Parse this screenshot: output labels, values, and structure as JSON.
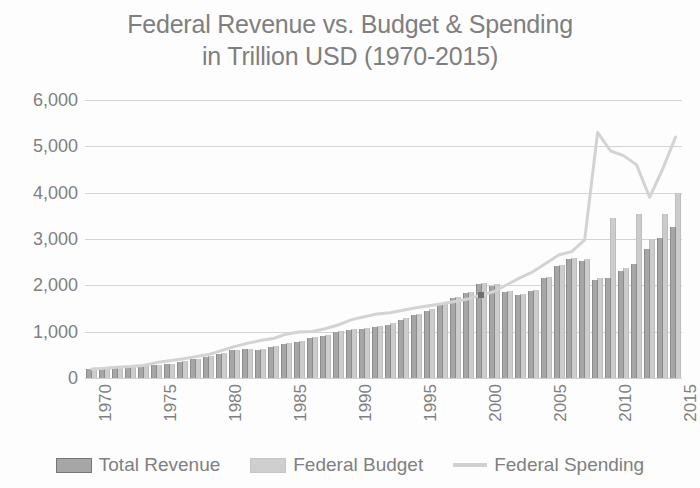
{
  "chart_data": {
    "type": "bar",
    "title": "Federal Revenue vs. Budget & Spending in Trillion USD (1970-2015)",
    "title_line1": "Federal Revenue vs. Budget & Spending",
    "title_line2": "in Trillion USD (1970-2015)",
    "xlabel": "",
    "ylabel": "",
    "ylim": [
      0,
      6000
    ],
    "ytick_labels": [
      "6,000",
      "5,000",
      "4,000",
      "3,000",
      "2,000",
      "1,000",
      "0"
    ],
    "ytick_values": [
      6000,
      5000,
      4000,
      3000,
      2000,
      1000,
      0
    ],
    "grid": true,
    "legend_position": "bottom",
    "categories": [
      1970,
      1971,
      1972,
      1973,
      1974,
      1975,
      1976,
      1977,
      1978,
      1979,
      1980,
      1981,
      1982,
      1983,
      1984,
      1985,
      1986,
      1987,
      1988,
      1989,
      1990,
      1991,
      1992,
      1993,
      1994,
      1995,
      1996,
      1997,
      1998,
      1999,
      2000,
      2001,
      2002,
      2003,
      2004,
      2005,
      2006,
      2007,
      2008,
      2009,
      2010,
      2011,
      2012,
      2013,
      2014,
      2015
    ],
    "xtick_labels": [
      "1970",
      "1975",
      "1980",
      "1985",
      "1990",
      "1995",
      "2000",
      "2005",
      "2010",
      "2015"
    ],
    "series": [
      {
        "name": "Total Revenue",
        "type": "bar",
        "color": "#a6a6a6",
        "values": [
          193,
          187,
          207,
          231,
          263,
          279,
          298,
          356,
          400,
          463,
          517,
          599,
          618,
          601,
          666,
          734,
          769,
          854,
          909,
          991,
          1032,
          1055,
          1091,
          1154,
          1259,
          1352,
          1453,
          1579,
          1722,
          1827,
          2025,
          1991,
          1853,
          1782,
          1880,
          2154,
          2407,
          2568,
          2524,
          2105,
          2163,
          2304,
          2450,
          2775,
          3021,
          3250
        ]
      },
      {
        "name": "Federal Budget",
        "type": "bar",
        "color": "#cccccc",
        "values": [
          200,
          195,
          215,
          240,
          272,
          290,
          310,
          367,
          412,
          475,
          530,
          615,
          635,
          620,
          685,
          755,
          790,
          875,
          930,
          1010,
          1055,
          1080,
          1115,
          1180,
          1285,
          1380,
          1480,
          1605,
          1750,
          1855,
          2050,
          2020,
          1885,
          1815,
          1910,
          2190,
          2440,
          2600,
          2560,
          2150,
          3455,
          2380,
          3540,
          3000,
          3550,
          3999
        ]
      },
      {
        "name": "Federal Spending",
        "type": "line",
        "color": "#d3d3d3",
        "values": [
          195,
          210,
          231,
          246,
          269,
          332,
          372,
          409,
          459,
          504,
          591,
          678,
          746,
          808,
          852,
          946,
          990,
          1004,
          1064,
          1144,
          1253,
          1324,
          1382,
          1409,
          1462,
          1516,
          1560,
          1601,
          1653,
          1702,
          1789,
          1863,
          2011,
          2160,
          2293,
          2472,
          2655,
          2729,
          2983,
          3518,
          3457,
          3603,
          3537,
          3455,
          3506,
          3688
        ]
      }
    ],
    "spending_markers": [
      {
        "year": 2000,
        "value": 1789
      }
    ],
    "spending_path_values": [
      195,
      210,
      231,
      246,
      269,
      332,
      372,
      409,
      459,
      504,
      591,
      678,
      746,
      808,
      852,
      946,
      990,
      1004,
      1064,
      1144,
      1253,
      1324,
      1382,
      1409,
      1462,
      1516,
      1560,
      1601,
      1653,
      1702,
      1789,
      1863,
      2011,
      2160,
      2293,
      2472,
      2655,
      2729,
      2983,
      5300,
      4900,
      4800,
      4600,
      3900,
      4500,
      5200
    ]
  },
  "legend": {
    "items": [
      {
        "label": "Total Revenue",
        "kind": "bar-dark"
      },
      {
        "label": "Federal Budget",
        "kind": "bar-light"
      },
      {
        "label": "Federal Spending",
        "kind": "line"
      }
    ]
  },
  "colors": {
    "revenue": "#a6a6a6",
    "budget": "#cccccc",
    "spending": "#d3d3d3",
    "text": "#808080",
    "grid": "#d4d4d4",
    "background": "#fdfdfd"
  }
}
